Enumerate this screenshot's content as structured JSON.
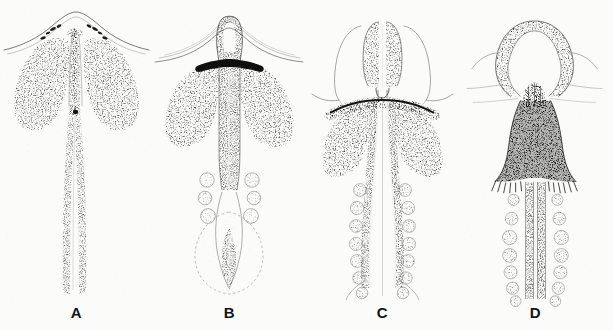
{
  "figure": {
    "kind": "scientific-illustration-plate",
    "style": "stippled pen-and-ink line drawing",
    "background_color": "#fbfbf9",
    "ink_color": "#2b2b2b",
    "panel_count": 4,
    "panels": [
      {
        "id": "a",
        "label": "A",
        "label_x": 73,
        "label_y": 310,
        "description": "Earliest stage: broad arching outer membrane over two large lateral stippled lobes, slender unpaired median shaft running the full length, no paired round bodies",
        "paired_round_bodies": 0,
        "lateral_lobes": 2,
        "apical_form": "broad low arch",
        "shaft_form": "single slender tapering shaft"
      },
      {
        "id": "b",
        "label": "B",
        "label_x": 243,
        "label_y": 310,
        "description": "Second stage: narrow apical loop with dark transverse band, two lateral stippled lobes, broad median column, three pairs of round bodies, faint terminal bulb below",
        "paired_round_bodies": 6,
        "round_body_pairs": 3,
        "lateral_lobes": 2,
        "apical_form": "narrow elongate loop with dark band",
        "shaft_form": "broad median column with faint terminal bulb"
      },
      {
        "id": "c",
        "label": "C",
        "label_x": 385,
        "label_y": 310,
        "description": "Third stage: two erect apical lobes flanked by pale outer wings, dark transverse band, two lateral stippled lobes, seven pairs of round bodies along paired shafts",
        "paired_round_bodies": 14,
        "round_body_pairs": 7,
        "lateral_lobes": 2,
        "apical_form": "paired erect dark lobes",
        "shaft_form": "paired diverging shafts"
      },
      {
        "id": "d",
        "label": "D",
        "label_x": 532,
        "label_y": 310,
        "description": "Final stage: large open horseshoe loop at apex, dense dark triangular body with fringed lower margin, seven pairs of round bodies flanking two parallel shafts",
        "paired_round_bodies": 14,
        "round_body_pairs": 7,
        "lateral_lobes": 0,
        "apical_form": "open horseshoe loop",
        "shaft_form": "two parallel descending shafts"
      }
    ]
  }
}
